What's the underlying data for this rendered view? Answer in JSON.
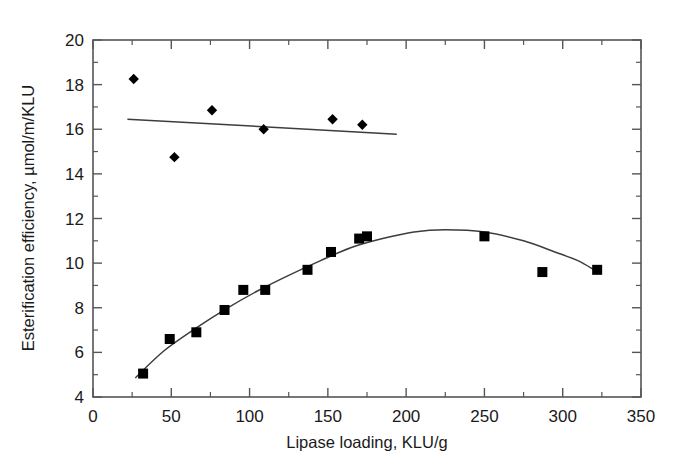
{
  "chart_data": {
    "type": "scatter",
    "title": "",
    "xlabel": "Lipase loading, KLU/g",
    "ylabel": "Esterification efficiency, µmol/m/KLU",
    "xlim": [
      0,
      350
    ],
    "ylim": [
      4,
      20
    ],
    "xticks": [
      0,
      50,
      100,
      150,
      200,
      250,
      300,
      350
    ],
    "yticks": [
      4,
      6,
      8,
      10,
      12,
      14,
      16,
      18,
      20
    ],
    "xtick_labels": [
      "0",
      "50",
      "100",
      "150",
      "200",
      "250",
      "300",
      "350"
    ],
    "ytick_labels": [
      "4",
      "6",
      "8",
      "10",
      "12",
      "14",
      "16",
      "18",
      "20"
    ],
    "minor_ticks": true,
    "grid": false,
    "legend": "none",
    "series": [
      {
        "name": "Esterification efficiency (diamonds)",
        "marker": "diamond",
        "color": "#000000",
        "points": [
          {
            "x": 26,
            "y": 18.25
          },
          {
            "x": 52,
            "y": 14.75
          },
          {
            "x": 76,
            "y": 16.85
          },
          {
            "x": 109,
            "y": 16.0
          },
          {
            "x": 153,
            "y": 16.45
          },
          {
            "x": 172,
            "y": 16.2
          }
        ],
        "fit": {
          "kind": "linear",
          "points": [
            {
              "x": 22,
              "y": 16.45
            },
            {
              "x": 194,
              "y": 15.78
            }
          ]
        }
      },
      {
        "name": "Esterification efficiency (squares)",
        "marker": "square",
        "color": "#000000",
        "points": [
          {
            "x": 32,
            "y": 5.05
          },
          {
            "x": 49,
            "y": 6.6
          },
          {
            "x": 66,
            "y": 6.9
          },
          {
            "x": 84,
            "y": 7.9
          },
          {
            "x": 96,
            "y": 8.8
          },
          {
            "x": 110,
            "y": 8.8
          },
          {
            "x": 137,
            "y": 9.7
          },
          {
            "x": 152,
            "y": 10.5
          },
          {
            "x": 170,
            "y": 11.1
          },
          {
            "x": 175,
            "y": 11.2
          },
          {
            "x": 250,
            "y": 11.2
          },
          {
            "x": 287,
            "y": 9.6
          },
          {
            "x": 322,
            "y": 9.7
          }
        ],
        "fit": {
          "kind": "curve",
          "points": [
            {
              "x": 27,
              "y": 4.85
            },
            {
              "x": 45,
              "y": 6.05
            },
            {
              "x": 65,
              "y": 7.05
            },
            {
              "x": 85,
              "y": 7.95
            },
            {
              "x": 105,
              "y": 8.75
            },
            {
              "x": 125,
              "y": 9.45
            },
            {
              "x": 145,
              "y": 10.1
            },
            {
              "x": 165,
              "y": 10.7
            },
            {
              "x": 185,
              "y": 11.1
            },
            {
              "x": 205,
              "y": 11.4
            },
            {
              "x": 225,
              "y": 11.5
            },
            {
              "x": 250,
              "y": 11.4
            },
            {
              "x": 275,
              "y": 11.0
            },
            {
              "x": 295,
              "y": 10.5
            },
            {
              "x": 310,
              "y": 10.1
            },
            {
              "x": 320,
              "y": 9.7
            }
          ]
        }
      }
    ]
  },
  "figure": {
    "axis_line_color": "#565656",
    "marker_color": "#000000",
    "background": "#ffffff"
  }
}
